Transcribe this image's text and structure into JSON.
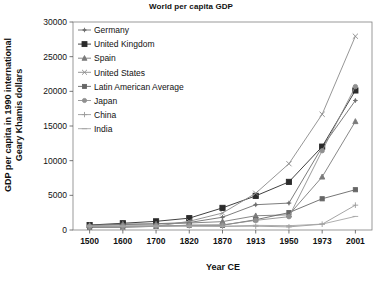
{
  "chart_data": {
    "type": "line",
    "title": "World per capita GDP",
    "xlabel": "Year CE",
    "ylabel": "GDP per capita in 1990 international Geary Khamis dollars",
    "ylabel_line1": "GDP per capita in 1990 international",
    "ylabel_line2": "Geary Khamis dollars",
    "categories": [
      "1500",
      "1600",
      "1700",
      "1820",
      "1870",
      "1913",
      "1950",
      "1973",
      "2001"
    ],
    "x": [
      1500,
      1600,
      1700,
      1820,
      1870,
      1913,
      1950,
      1973,
      2001
    ],
    "ylim": [
      0,
      30000
    ],
    "yticks": [
      0,
      5000,
      10000,
      15000,
      20000,
      25000,
      30000
    ],
    "ytick_labels": [
      "0",
      "5000",
      "10000",
      "15000",
      "20000",
      "25000",
      "30000"
    ],
    "grid": false,
    "legend_position": "upper-left-inside",
    "series": [
      {
        "name": "Germany",
        "marker": "plus-dot",
        "color": "#6e6e6e",
        "values": [
          688,
          791,
          910,
          1077,
          1839,
          3648,
          3881,
          11966,
          18677
        ]
      },
      {
        "name": "United Kingdom",
        "marker": "square",
        "color": "#2b2b2b",
        "values": [
          714,
          974,
          1250,
          1706,
          3190,
          4921,
          6939,
          12025,
          20127
        ]
      },
      {
        "name": "Spain",
        "marker": "triangle",
        "color": "#7a7a7a",
        "values": [
          661,
          853,
          853,
          1008,
          1207,
          2056,
          2189,
          7661,
          15659
        ]
      },
      {
        "name": "United States",
        "marker": "x",
        "color": "#8a8a8a",
        "values": [
          400,
          400,
          527,
          1257,
          2445,
          5301,
          9561,
          16689,
          27948
        ]
      },
      {
        "name": "Latin American Average",
        "marker": "square-sm",
        "color": "#666666",
        "values": [
          416,
          438,
          527,
          692,
          681,
          1481,
          2506,
          4504,
          5811
        ]
      },
      {
        "name": "Japan",
        "marker": "circle",
        "color": "#909090",
        "values": [
          500,
          520,
          570,
          669,
          737,
          1387,
          1921,
          11434,
          20683
        ]
      },
      {
        "name": "China",
        "marker": "plus",
        "color": "#9a9a9a",
        "values": [
          600,
          600,
          600,
          600,
          530,
          552,
          448,
          838,
          3583
        ]
      },
      {
        "name": "India",
        "marker": "dash",
        "color": "#a5a5a5",
        "values": [
          550,
          550,
          550,
          533,
          533,
          673,
          619,
          853,
          1957
        ]
      }
    ]
  },
  "axes": {
    "plot_left": 73,
    "plot_right": 372,
    "plot_top": 22,
    "plot_bottom": 230
  }
}
